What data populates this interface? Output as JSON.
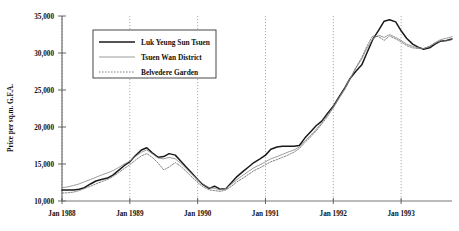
{
  "chart_data": {
    "type": "line",
    "title": "",
    "xlabel": "",
    "ylabel": "Price per sq.m. G.F.A.",
    "ylim": [
      10000,
      35000
    ],
    "yticks": [
      10000,
      15000,
      20000,
      25000,
      30000,
      35000
    ],
    "ytick_labels": [
      "10,000",
      "15,000",
      "20,000",
      "25,000",
      "30,000",
      "35,000"
    ],
    "xticks": [
      "Jan 1988",
      "Jan 1989",
      "Jan 1990",
      "Jan 1991",
      "Jan 1992",
      "Jan 1993"
    ],
    "xlim": [
      "Jan 1988",
      "Jul 1993"
    ],
    "grid": "vertical-dotted",
    "legend_position": "top-left-inside",
    "series": [
      {
        "name": "Luk Yeung Sun Tsuen",
        "style": "solid-thick",
        "color": "#1a1a1a",
        "points": [
          [
            0.0,
            11500
          ],
          [
            0.08,
            11500
          ],
          [
            0.17,
            11500
          ],
          [
            0.25,
            11600
          ],
          [
            0.33,
            11800
          ],
          [
            0.42,
            12300
          ],
          [
            0.5,
            12700
          ],
          [
            0.58,
            12900
          ],
          [
            0.67,
            13100
          ],
          [
            0.75,
            13500
          ],
          [
            0.83,
            14100
          ],
          [
            0.92,
            14800
          ],
          [
            1.0,
            15300
          ],
          [
            1.08,
            16100
          ],
          [
            1.17,
            16900
          ],
          [
            1.25,
            17200
          ],
          [
            1.33,
            16500
          ],
          [
            1.42,
            15900
          ],
          [
            1.5,
            16000
          ],
          [
            1.58,
            16400
          ],
          [
            1.67,
            16200
          ],
          [
            1.75,
            15400
          ],
          [
            1.83,
            14600
          ],
          [
            1.92,
            13700
          ],
          [
            2.0,
            12900
          ],
          [
            2.08,
            12200
          ],
          [
            2.17,
            11700
          ],
          [
            2.25,
            12000
          ],
          [
            2.33,
            11600
          ],
          [
            2.42,
            11700
          ],
          [
            2.5,
            12500
          ],
          [
            2.58,
            13300
          ],
          [
            2.67,
            14000
          ],
          [
            2.75,
            14600
          ],
          [
            2.83,
            15200
          ],
          [
            2.92,
            15700
          ],
          [
            3.0,
            16200
          ],
          [
            3.08,
            17000
          ],
          [
            3.17,
            17300
          ],
          [
            3.25,
            17400
          ],
          [
            3.33,
            17400
          ],
          [
            3.42,
            17400
          ],
          [
            3.5,
            17500
          ],
          [
            3.58,
            18500
          ],
          [
            3.67,
            19400
          ],
          [
            3.75,
            20200
          ],
          [
            3.83,
            20800
          ],
          [
            3.92,
            21900
          ],
          [
            4.0,
            22800
          ],
          [
            4.08,
            24000
          ],
          [
            4.17,
            25300
          ],
          [
            4.25,
            26600
          ],
          [
            4.33,
            27500
          ],
          [
            4.42,
            28400
          ],
          [
            4.5,
            30100
          ],
          [
            4.58,
            31800
          ],
          [
            4.67,
            33100
          ],
          [
            4.75,
            34300
          ],
          [
            4.83,
            34500
          ],
          [
            4.92,
            34200
          ],
          [
            5.0,
            33000
          ],
          [
            5.08,
            32000
          ],
          [
            5.17,
            31200
          ],
          [
            5.25,
            30800
          ],
          [
            5.33,
            30500
          ],
          [
            5.42,
            30700
          ],
          [
            5.5,
            31200
          ],
          [
            5.58,
            31600
          ],
          [
            5.67,
            31700
          ],
          [
            5.75,
            31900
          ]
        ]
      },
      {
        "name": "Tsuen Wan District",
        "style": "solid-thin",
        "color": "#8a8a8a",
        "points": [
          [
            0.0,
            11800
          ],
          [
            0.08,
            11900
          ],
          [
            0.17,
            12100
          ],
          [
            0.25,
            12300
          ],
          [
            0.33,
            12600
          ],
          [
            0.42,
            12900
          ],
          [
            0.5,
            13200
          ],
          [
            0.58,
            13500
          ],
          [
            0.67,
            13800
          ],
          [
            0.75,
            14100
          ],
          [
            0.83,
            14500
          ],
          [
            0.92,
            15000
          ],
          [
            1.0,
            15400
          ],
          [
            1.08,
            16000
          ],
          [
            1.17,
            16600
          ],
          [
            1.25,
            16900
          ],
          [
            1.33,
            16400
          ],
          [
            1.42,
            15800
          ],
          [
            1.5,
            15700
          ],
          [
            1.58,
            15900
          ],
          [
            1.67,
            15700
          ],
          [
            1.75,
            15100
          ],
          [
            1.83,
            14400
          ],
          [
            1.92,
            13600
          ],
          [
            2.0,
            12900
          ],
          [
            2.08,
            12300
          ],
          [
            2.17,
            11800
          ],
          [
            2.25,
            11700
          ],
          [
            2.33,
            11500
          ],
          [
            2.42,
            11700
          ],
          [
            2.5,
            12300
          ],
          [
            2.58,
            12900
          ],
          [
            2.67,
            13500
          ],
          [
            2.75,
            14000
          ],
          [
            2.83,
            14500
          ],
          [
            2.92,
            14900
          ],
          [
            3.0,
            15300
          ],
          [
            3.08,
            15700
          ],
          [
            3.17,
            16000
          ],
          [
            3.25,
            16300
          ],
          [
            3.33,
            16600
          ],
          [
            3.42,
            16900
          ],
          [
            3.5,
            17300
          ],
          [
            3.58,
            18100
          ],
          [
            3.67,
            18900
          ],
          [
            3.75,
            19700
          ],
          [
            3.83,
            20600
          ],
          [
            3.92,
            21700
          ],
          [
            4.0,
            22700
          ],
          [
            4.08,
            23900
          ],
          [
            4.17,
            25200
          ],
          [
            4.25,
            26600
          ],
          [
            4.33,
            27900
          ],
          [
            4.42,
            29200
          ],
          [
            4.5,
            30700
          ],
          [
            4.58,
            31900
          ],
          [
            4.67,
            32400
          ],
          [
            4.75,
            32100
          ],
          [
            4.83,
            32500
          ],
          [
            4.92,
            32100
          ],
          [
            5.0,
            31700
          ],
          [
            5.08,
            31200
          ],
          [
            5.17,
            30900
          ],
          [
            5.25,
            30700
          ],
          [
            5.33,
            30600
          ],
          [
            5.42,
            30900
          ],
          [
            5.5,
            31400
          ],
          [
            5.58,
            31800
          ],
          [
            5.67,
            32000
          ],
          [
            5.75,
            32200
          ]
        ]
      },
      {
        "name": "Belvedere Garden",
        "style": "dotted",
        "color": "#6e6e6e",
        "points": [
          [
            0.0,
            11100
          ],
          [
            0.08,
            11100
          ],
          [
            0.17,
            11200
          ],
          [
            0.25,
            11400
          ],
          [
            0.33,
            11700
          ],
          [
            0.42,
            12000
          ],
          [
            0.5,
            12300
          ],
          [
            0.58,
            12600
          ],
          [
            0.67,
            12900
          ],
          [
            0.75,
            13300
          ],
          [
            0.83,
            13800
          ],
          [
            0.92,
            14400
          ],
          [
            1.0,
            14900
          ],
          [
            1.08,
            15500
          ],
          [
            1.17,
            16100
          ],
          [
            1.25,
            16400
          ],
          [
            1.33,
            15900
          ],
          [
            1.42,
            15100
          ],
          [
            1.5,
            14200
          ],
          [
            1.58,
            14600
          ],
          [
            1.67,
            15200
          ],
          [
            1.75,
            14700
          ],
          [
            1.83,
            14000
          ],
          [
            1.92,
            13200
          ],
          [
            2.0,
            12500
          ],
          [
            2.08,
            11900
          ],
          [
            2.17,
            11500
          ],
          [
            2.25,
            11400
          ],
          [
            2.33,
            11300
          ],
          [
            2.42,
            11500
          ],
          [
            2.5,
            12000
          ],
          [
            2.58,
            12600
          ],
          [
            2.67,
            13100
          ],
          [
            2.75,
            13600
          ],
          [
            2.83,
            14100
          ],
          [
            2.92,
            14500
          ],
          [
            3.0,
            14900
          ],
          [
            3.08,
            15300
          ],
          [
            3.17,
            15600
          ],
          [
            3.25,
            15900
          ],
          [
            3.33,
            16200
          ],
          [
            3.42,
            16600
          ],
          [
            3.5,
            17100
          ],
          [
            3.58,
            17900
          ],
          [
            3.67,
            18700
          ],
          [
            3.75,
            19500
          ],
          [
            3.83,
            20400
          ],
          [
            3.92,
            21500
          ],
          [
            4.0,
            22600
          ],
          [
            4.08,
            23800
          ],
          [
            4.17,
            25100
          ],
          [
            4.25,
            26500
          ],
          [
            4.33,
            28000
          ],
          [
            4.42,
            29400
          ],
          [
            4.5,
            31000
          ],
          [
            4.58,
            32300
          ],
          [
            4.67,
            32200
          ],
          [
            4.75,
            31700
          ],
          [
            4.83,
            32300
          ],
          [
            4.92,
            31900
          ],
          [
            5.0,
            31500
          ],
          [
            5.08,
            31000
          ],
          [
            5.17,
            30700
          ],
          [
            5.25,
            30600
          ],
          [
            5.33,
            30600
          ],
          [
            5.42,
            30900
          ],
          [
            5.5,
            31300
          ],
          [
            5.58,
            31600
          ],
          [
            5.67,
            31700
          ],
          [
            5.75,
            31800
          ]
        ]
      }
    ],
    "legend": [
      {
        "label": "Luk Yeung Sun Tsuen",
        "style": "solid-thick"
      },
      {
        "label": "Tsuen Wan District",
        "style": "solid-thin"
      },
      {
        "label": "Belvedere Garden",
        "style": "dotted"
      }
    ]
  }
}
